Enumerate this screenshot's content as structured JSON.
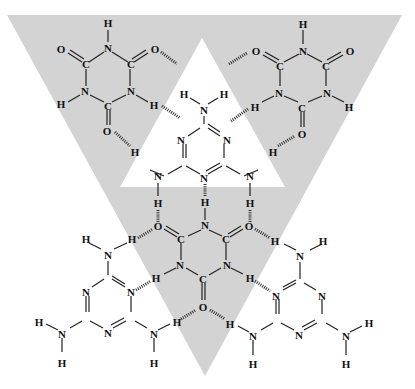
{
  "diagram": {
    "type": "supramolecular hydrogen-bonded network",
    "background_color": "#ffffff",
    "shapes": {
      "outer_triangle": {
        "color": "#d3d3d3",
        "points": [
          [
            7,
            15
          ],
          [
            402,
            15
          ],
          [
            205,
            376
          ]
        ],
        "orientation": "inverted"
      },
      "inner_triangle": {
        "color": "#ffffff",
        "points": [
          [
            202,
            38
          ],
          [
            285,
            187
          ],
          [
            120,
            187
          ]
        ],
        "orientation": "upright"
      }
    },
    "molecules": [
      {
        "id": "cya-top-left",
        "name": "cyanuric acid",
        "center": [
          104,
          72
        ]
      },
      {
        "id": "cya-top-right",
        "name": "cyanuric acid",
        "center": [
          301,
          72
        ]
      },
      {
        "id": "mel-center",
        "name": "melamine",
        "center": [
          204,
          143
        ]
      },
      {
        "id": "cya-center",
        "name": "cyanuric acid",
        "center": [
          203,
          266
        ]
      },
      {
        "id": "mel-bottom-left",
        "name": "melamine",
        "center": [
          106,
          278
        ]
      },
      {
        "id": "mel-bottom-right",
        "name": "melamine",
        "center": [
          303,
          278
        ]
      }
    ],
    "labels": {
      "H": "H",
      "N": "N",
      "C": "C",
      "O": "O"
    }
  }
}
